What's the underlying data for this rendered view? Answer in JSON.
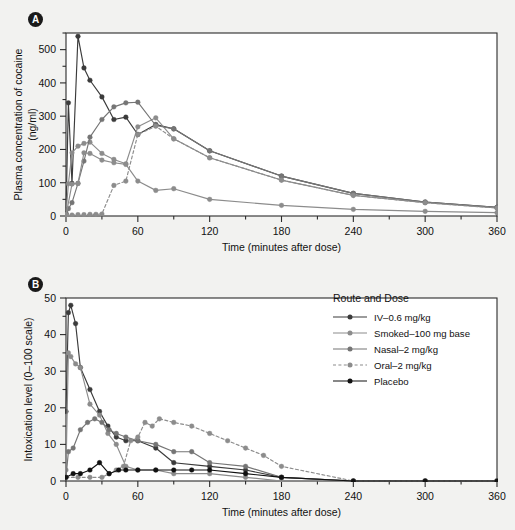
{
  "figure": {
    "background": "#f2f2f0",
    "panel_a_label": "A",
    "panel_b_label": "B"
  },
  "legend": {
    "title": "Route and Dose",
    "entries": [
      {
        "label": "IV–0.6 mg/kg",
        "color": "#3b3b3b",
        "dash": "none",
        "key": "legend-key-iv"
      },
      {
        "label": "Smoked–100 mg base",
        "color": "#8c8c8c",
        "dash": "none",
        "key": "legend-key-smoked"
      },
      {
        "label": "Nasal–2 mg/kg",
        "color": "#757575",
        "dash": "none",
        "key": "legend-key-nasal"
      },
      {
        "label": "Oral–2 mg/kg",
        "color": "#8c8c8c",
        "dash": "dashed",
        "key": "legend-key-oral"
      },
      {
        "label": "Placebo",
        "color": "#111111",
        "dash": "none",
        "key": "legend-key-placebo"
      }
    ]
  },
  "chart_data": [
    {
      "panel": "A",
      "type": "line",
      "title": "",
      "xlabel": "Time (minutes after dose)",
      "ylabel": "Plasma concentration of cocaine\n(ng/ml)",
      "ylabel_line1": "Plasma concentration of cocaine",
      "ylabel_line2": "(ng/ml)",
      "xlim": [
        0,
        360
      ],
      "ylim": [
        0,
        550
      ],
      "xticks": [
        0,
        60,
        120,
        180,
        240,
        300,
        360
      ],
      "xtick_labels": [
        "0",
        "60",
        "120",
        "180",
        "240",
        "300",
        "360"
      ],
      "xminor_step": 30,
      "yticks": [
        0,
        100,
        200,
        300,
        400,
        500
      ],
      "ytick_labels": [
        "0",
        "100",
        "200",
        "300",
        "400",
        "500"
      ],
      "yminor_step": 50,
      "grid": false,
      "legend_position": "none",
      "series": [
        {
          "name": "IV–0.6 mg/kg",
          "color": "#3b3b3b",
          "dash": "none",
          "x": [
            0,
            2,
            5,
            10,
            15,
            20,
            30,
            40,
            50,
            60,
            75,
            90,
            120,
            180,
            240,
            300,
            360
          ],
          "y": [
            8,
            340,
            98,
            540,
            445,
            408,
            358,
            290,
            297,
            245,
            275,
            262,
            196,
            120,
            68,
            42,
            26
          ]
        },
        {
          "name": "Smoked–100 mg base",
          "color": "#8c8c8c",
          "dash": "none",
          "x": [
            0,
            2,
            5,
            10,
            15,
            20,
            30,
            40,
            50,
            60,
            75,
            90,
            120,
            180,
            240,
            300,
            360
          ],
          "y": [
            5,
            97,
            190,
            210,
            218,
            222,
            188,
            170,
            157,
            268,
            295,
            232,
            175,
            108,
            62,
            40,
            24
          ]
        },
        {
          "name": "Nasal–2 mg/kg",
          "color": "#757575",
          "dash": "none",
          "x": [
            0,
            2,
            5,
            10,
            15,
            20,
            30,
            40,
            50,
            60,
            75,
            90,
            120,
            180,
            240,
            300,
            360
          ],
          "y": [
            3,
            22,
            40,
            98,
            165,
            237,
            290,
            328,
            340,
            342,
            272,
            262,
            196,
            120,
            68,
            42,
            26
          ]
        },
        {
          "name": "Oral–2 mg/kg",
          "color": "#8c8c8c",
          "dash": "dashed",
          "x": [
            0,
            5,
            10,
            15,
            20,
            25,
            30,
            40,
            50,
            60,
            75,
            90,
            120,
            180,
            240,
            300,
            360
          ],
          "y": [
            2,
            3,
            4,
            4,
            5,
            5,
            6,
            92,
            105,
            245,
            270,
            232,
            175,
            108,
            62,
            40,
            24
          ]
        },
        {
          "name": "Placebo",
          "color": "#8c8c8c",
          "dash": "none",
          "x": [
            0,
            5,
            10,
            15,
            20,
            30,
            40,
            50,
            60,
            75,
            90,
            120,
            180,
            240,
            300,
            360
          ],
          "y": [
            2,
            96,
            98,
            190,
            188,
            168,
            160,
            155,
            105,
            77,
            82,
            50,
            32,
            20,
            14,
            10
          ]
        }
      ]
    },
    {
      "panel": "B",
      "type": "line",
      "title": "",
      "xlabel": "Time (minutes after dose)",
      "ylabel": "Intoxication level (0–100 scale)",
      "xlim": [
        0,
        360
      ],
      "ylim": [
        0,
        50
      ],
      "xticks": [
        0,
        60,
        120,
        180,
        240,
        300,
        360
      ],
      "xtick_labels": [
        "0",
        "60",
        "120",
        "180",
        "240",
        "300",
        "360"
      ],
      "xminor_step": 30,
      "yticks": [
        0,
        10,
        20,
        30,
        40,
        50
      ],
      "ytick_labels": [
        "0",
        "10",
        "20",
        "30",
        "40",
        "50"
      ],
      "yminor_step": 5,
      "grid": false,
      "legend_position": "upper-right",
      "series": [
        {
          "name": "IV–0.6 mg/kg",
          "color": "#3b3b3b",
          "dash": "none",
          "x": [
            0,
            2,
            4,
            8,
            12,
            20,
            28,
            35,
            42,
            50,
            60,
            75,
            90,
            120,
            150,
            180,
            240,
            300,
            360
          ],
          "y": [
            19,
            46,
            48,
            43,
            31,
            25,
            19,
            15,
            12,
            11,
            11,
            9,
            5,
            4,
            3,
            1,
            0,
            0,
            0
          ]
        },
        {
          "name": "Smoked–100 mg base",
          "color": "#8c8c8c",
          "dash": "none",
          "x": [
            0,
            2,
            4,
            8,
            12,
            20,
            28,
            35,
            42,
            50,
            60,
            75,
            90,
            120,
            150,
            180,
            240,
            300,
            360
          ],
          "y": [
            3,
            35,
            34,
            32,
            31,
            21,
            18,
            13,
            10,
            4,
            3,
            3,
            2,
            2,
            1,
            0,
            0,
            0,
            0
          ]
        },
        {
          "name": "Nasal–2 mg/kg",
          "color": "#757575",
          "dash": "none",
          "x": [
            0,
            2,
            6,
            12,
            18,
            24,
            30,
            36,
            42,
            50,
            60,
            75,
            90,
            105,
            120,
            150,
            180,
            240,
            300,
            360
          ],
          "y": [
            1,
            8,
            9,
            14,
            16,
            17,
            16,
            14,
            13,
            12,
            11,
            10,
            8,
            8,
            5,
            4,
            1,
            0,
            0,
            0
          ]
        },
        {
          "name": "Oral–2 mg/kg",
          "color": "#8c8c8c",
          "dash": "dashed",
          "x": [
            0,
            10,
            20,
            30,
            36,
            42,
            48,
            54,
            60,
            66,
            72,
            78,
            90,
            105,
            120,
            135,
            150,
            165,
            180,
            240,
            300,
            360
          ],
          "y": [
            1,
            1,
            1,
            1,
            2,
            3,
            4,
            11,
            12,
            16,
            15,
            17,
            16,
            15,
            13,
            11,
            9,
            7,
            4,
            0,
            0,
            0
          ]
        },
        {
          "name": "Placebo",
          "color": "#111111",
          "dash": "none",
          "x": [
            0,
            6,
            12,
            20,
            28,
            36,
            44,
            50,
            60,
            75,
            90,
            105,
            120,
            150,
            180,
            240,
            300,
            360
          ],
          "y": [
            1,
            2,
            2,
            3,
            5,
            2,
            3,
            3,
            3,
            3,
            3,
            3,
            3,
            2,
            1,
            0,
            0,
            0
          ]
        }
      ]
    }
  ]
}
